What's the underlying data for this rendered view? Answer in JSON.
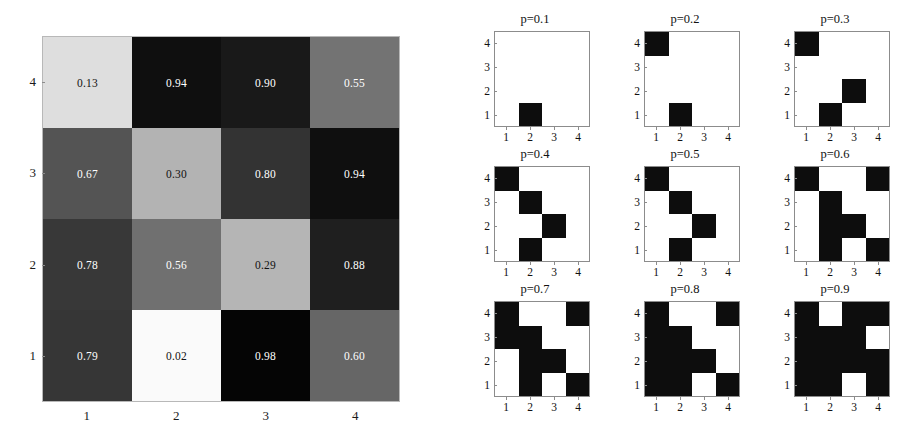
{
  "figure": {
    "title": "",
    "background_color": "#ffffff"
  },
  "chart_data": [
    {
      "type": "heatmap",
      "name": "value-matrix",
      "title": "",
      "xlabel": "",
      "ylabel": "",
      "colormap": "grayscale-inverted",
      "value_range": [
        0.0,
        1.0
      ],
      "x_tick_labels": [
        "1",
        "2",
        "3",
        "4"
      ],
      "y_tick_labels": [
        "1",
        "2",
        "3",
        "4"
      ],
      "row_order_top_to_bottom": [
        "4",
        "3",
        "2",
        "1"
      ],
      "cell_labels": true,
      "rows": [
        {
          "row": "4",
          "values": [
            0.13,
            0.94,
            0.9,
            0.55
          ],
          "labels": [
            "0.13",
            "0.94",
            "0.90",
            "0.55"
          ]
        },
        {
          "row": "3",
          "values": [
            0.67,
            0.3,
            0.8,
            0.94
          ],
          "labels": [
            "0.67",
            "0.30",
            "0.80",
            "0.94"
          ]
        },
        {
          "row": "2",
          "values": [
            0.78,
            0.56,
            0.29,
            0.88
          ],
          "labels": [
            "0.78",
            "0.56",
            "0.29",
            "0.88"
          ]
        },
        {
          "row": "1",
          "values": [
            0.79,
            0.02,
            0.98,
            0.6
          ],
          "labels": [
            "0.79",
            "0.02",
            "0.98",
            "0.60"
          ]
        }
      ]
    },
    {
      "type": "heatmap",
      "name": "binary-threshold-grid",
      "subplot_layout": [
        3,
        3
      ],
      "x_tick_labels": [
        "1",
        "2",
        "3",
        "4"
      ],
      "y_tick_labels": [
        "1",
        "2",
        "3",
        "4"
      ],
      "row_order_top_to_bottom": [
        "4",
        "3",
        "2",
        "1"
      ],
      "on_color": "#0d0d0d",
      "off_color": "#ffffff",
      "panels": [
        {
          "title": "p=0.1",
          "p": 0.1,
          "matrix": [
            [
              0,
              0,
              0,
              0
            ],
            [
              0,
              0,
              0,
              0
            ],
            [
              0,
              0,
              0,
              0
            ],
            [
              0,
              1,
              0,
              0
            ]
          ]
        },
        {
          "title": "p=0.2",
          "p": 0.2,
          "matrix": [
            [
              1,
              0,
              0,
              0
            ],
            [
              0,
              0,
              0,
              0
            ],
            [
              0,
              0,
              0,
              0
            ],
            [
              0,
              1,
              0,
              0
            ]
          ]
        },
        {
          "title": "p=0.3",
          "p": 0.3,
          "matrix": [
            [
              1,
              0,
              0,
              0
            ],
            [
              0,
              0,
              0,
              0
            ],
            [
              0,
              0,
              1,
              0
            ],
            [
              0,
              1,
              0,
              0
            ]
          ]
        },
        {
          "title": "p=0.4",
          "p": 0.4,
          "matrix": [
            [
              1,
              0,
              0,
              0
            ],
            [
              0,
              1,
              0,
              0
            ],
            [
              0,
              0,
              1,
              0
            ],
            [
              0,
              1,
              0,
              0
            ]
          ]
        },
        {
          "title": "p=0.5",
          "p": 0.5,
          "matrix": [
            [
              1,
              0,
              0,
              0
            ],
            [
              0,
              1,
              0,
              0
            ],
            [
              0,
              0,
              1,
              0
            ],
            [
              0,
              1,
              0,
              0
            ]
          ]
        },
        {
          "title": "p=0.6",
          "p": 0.6,
          "matrix": [
            [
              1,
              0,
              0,
              1
            ],
            [
              0,
              1,
              0,
              0
            ],
            [
              0,
              1,
              1,
              0
            ],
            [
              0,
              1,
              0,
              1
            ]
          ]
        },
        {
          "title": "p=0.7",
          "p": 0.7,
          "matrix": [
            [
              1,
              0,
              0,
              1
            ],
            [
              1,
              1,
              0,
              0
            ],
            [
              0,
              1,
              1,
              0
            ],
            [
              0,
              1,
              0,
              1
            ]
          ]
        },
        {
          "title": "p=0.8",
          "p": 0.8,
          "matrix": [
            [
              1,
              0,
              0,
              1
            ],
            [
              1,
              1,
              0,
              0
            ],
            [
              1,
              1,
              1,
              0
            ],
            [
              1,
              1,
              0,
              1
            ]
          ]
        },
        {
          "title": "p=0.9",
          "p": 0.9,
          "matrix": [
            [
              1,
              0,
              1,
              1
            ],
            [
              1,
              1,
              1,
              0
            ],
            [
              1,
              1,
              1,
              1
            ],
            [
              1,
              1,
              0,
              1
            ]
          ]
        }
      ]
    }
  ]
}
